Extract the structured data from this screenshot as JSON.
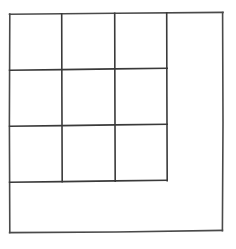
{
  "figure": {
    "title": "",
    "caption": "",
    "shape_type": "nested-square-grid",
    "background_color": "#ffffff",
    "stroke_color": "#4a4a4a",
    "stroke_color_dark": "#3a3a3a",
    "stroke_width": 1.6,
    "outer_square": {
      "name": "outer-square",
      "left": 9,
      "top": 13,
      "right": 223,
      "bottom": 231,
      "width": 214,
      "height": 218,
      "fill": "none"
    },
    "inner_grid": {
      "name": "inner-grid",
      "rows": 3,
      "columns": 3,
      "left": 9,
      "top": 13,
      "right": 167,
      "bottom": 181,
      "cell_width": 53,
      "cell_height": 56,
      "vertical_divider_x": [
        62,
        115,
        167
      ],
      "horizontal_divider_y": [
        69,
        125,
        181
      ],
      "cell_count": 9,
      "cells": [
        {
          "id": "r1c1",
          "row": 1,
          "col": 1,
          "x": 9,
          "y": 13,
          "w": 53,
          "h": 56,
          "label": ""
        },
        {
          "id": "r1c2",
          "row": 1,
          "col": 2,
          "x": 62,
          "y": 13,
          "w": 53,
          "h": 56,
          "label": ""
        },
        {
          "id": "r1c3",
          "row": 1,
          "col": 3,
          "x": 115,
          "y": 13,
          "w": 52,
          "h": 56,
          "label": ""
        },
        {
          "id": "r2c1",
          "row": 2,
          "col": 1,
          "x": 9,
          "y": 69,
          "w": 53,
          "h": 56,
          "label": ""
        },
        {
          "id": "r2c2",
          "row": 2,
          "col": 2,
          "x": 62,
          "y": 69,
          "w": 53,
          "h": 56,
          "label": ""
        },
        {
          "id": "r2c3",
          "row": 2,
          "col": 3,
          "x": 115,
          "y": 69,
          "w": 52,
          "h": 56,
          "label": ""
        },
        {
          "id": "r3c1",
          "row": 3,
          "col": 1,
          "x": 9,
          "y": 125,
          "w": 53,
          "h": 56,
          "label": ""
        },
        {
          "id": "r3c2",
          "row": 3,
          "col": 2,
          "x": 62,
          "y": 125,
          "w": 53,
          "h": 56,
          "label": ""
        },
        {
          "id": "r3c3",
          "row": 3,
          "col": 3,
          "x": 115,
          "y": 125,
          "w": 52,
          "h": 56,
          "label": ""
        }
      ]
    },
    "remainder_region": {
      "name": "remainder-l-region",
      "shape": "L-shape",
      "label": "",
      "right_strip": {
        "x": 167,
        "y": 13,
        "w": 56,
        "h": 218
      },
      "bottom_strip": {
        "x": 9,
        "y": 181,
        "w": 214,
        "h": 50
      }
    }
  }
}
